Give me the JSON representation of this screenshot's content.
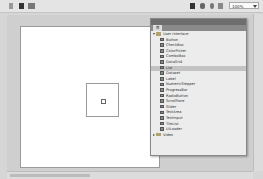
{
  "toolbar": {
    "left_icons": [
      "back-arrow-icon",
      "scene-icon",
      "symbol-edit-icon"
    ],
    "right_icons": [
      "camera-icon",
      "symbol-icon",
      "center-icon",
      "fit-icon"
    ],
    "zoom_value": "100%"
  },
  "panel": {
    "tab_label": "库",
    "tree": [
      {
        "type": "folder",
        "label": "User Interface",
        "expanded": true
      },
      {
        "type": "item",
        "label": "Button"
      },
      {
        "type": "item",
        "label": "CheckBox"
      },
      {
        "type": "item",
        "label": "ColorPicker"
      },
      {
        "type": "item",
        "label": "ComboBox"
      },
      {
        "type": "item",
        "label": "DataGrid"
      },
      {
        "type": "item",
        "label": "List",
        "selected": true
      },
      {
        "type": "item",
        "label": "Dataset"
      },
      {
        "type": "item",
        "label": "Label"
      },
      {
        "type": "item",
        "label": "NumericStepper"
      },
      {
        "type": "item",
        "label": "ProgressBar"
      },
      {
        "type": "item",
        "label": "RadioButton"
      },
      {
        "type": "item",
        "label": "ScrollPane"
      },
      {
        "type": "item",
        "label": "Slider"
      },
      {
        "type": "item",
        "label": "TextArea"
      },
      {
        "type": "item",
        "label": "TextInput"
      },
      {
        "type": "item",
        "label": "TileList"
      },
      {
        "type": "item",
        "label": "UILoader"
      },
      {
        "type": "folder",
        "label": "Video",
        "expanded": false
      }
    ]
  },
  "colors": {
    "selected_row": "#c3c3c3",
    "panel_header": "#6e6e6e",
    "stage_bg": "#cfcfcf"
  }
}
